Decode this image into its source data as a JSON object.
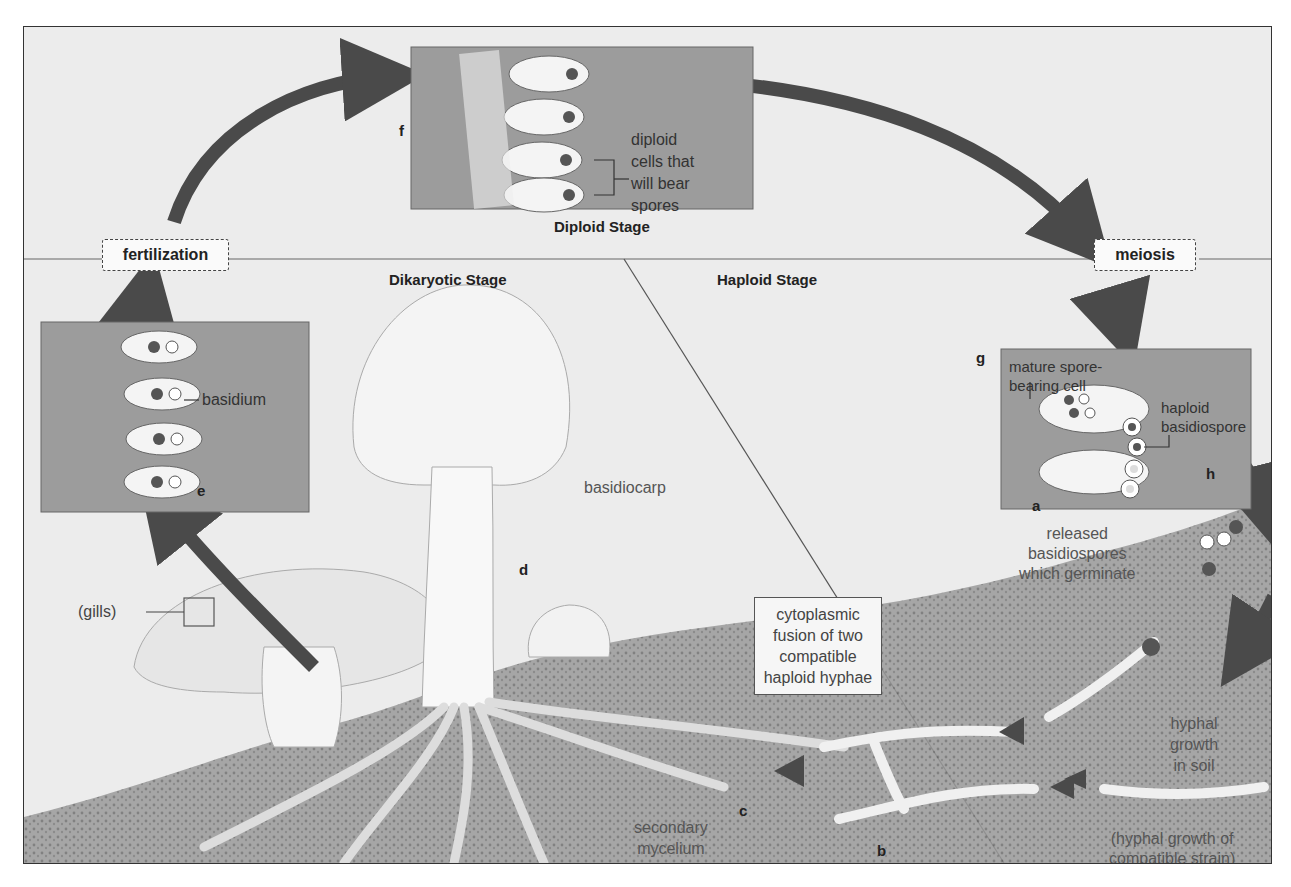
{
  "diagram": {
    "stages": {
      "diploid": "Diploid Stage",
      "dikaryotic": "Dikaryotic Stage",
      "haploid": "Haploid Stage"
    },
    "events": {
      "fertilization": "fertilization",
      "meiosis": "meiosis"
    },
    "letters": {
      "a": "a",
      "b": "b",
      "c": "c",
      "d": "d",
      "e": "e",
      "f": "f",
      "g": "g",
      "h": "h"
    },
    "labels": {
      "diploid_cells_1": "diploid",
      "diploid_cells_2": "cells that",
      "diploid_cells_3": "will bear",
      "diploid_cells_4": "spores",
      "basidium": "basidium",
      "basidiocarp": "basidiocarp",
      "gills": "(gills)",
      "mature_cell_1": "mature spore-",
      "mature_cell_2": "bearing cell",
      "haploid_spore_1": "haploid",
      "haploid_spore_2": "basidiospore",
      "released_1": "released",
      "released_2": "basidiospores",
      "released_3": "which germinate",
      "fusion_1": "cytoplasmic",
      "fusion_2": "fusion of two",
      "fusion_3": "compatible",
      "fusion_4": "haploid hyphae",
      "hyphal_soil_1": "hyphal",
      "hyphal_soil_2": "growth",
      "hyphal_soil_3": "in soil",
      "compatible_1": "(hyphal growth of",
      "compatible_2": "compatible strain)",
      "primary": "primary mycelium",
      "secondary_1": "secondary",
      "secondary_2": "mycelium"
    },
    "colors": {
      "background": "#ececec",
      "inset_box": "#9c9c9c",
      "arrow": "#4a4a4a",
      "soil": "#8a8a8a",
      "mushroom": "#f2f2f2"
    }
  }
}
